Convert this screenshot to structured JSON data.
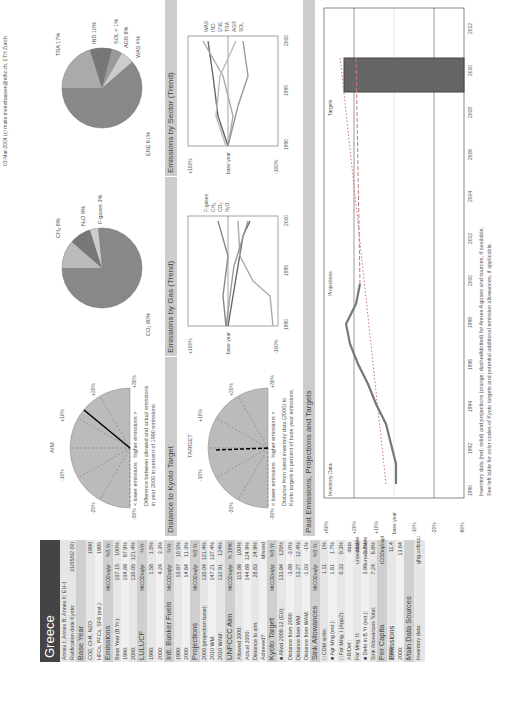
{
  "country": "Greece",
  "left": {
    "meta": [
      {
        "label": "Annex I; Annex B; Annex II; EU-15",
        "v": "",
        "p": ""
      },
      {
        "label": "Ratification date Kyoto:",
        "v": "31/05/02 (R)",
        "p": ""
      }
    ],
    "sections": [
      {
        "title": "Base Year",
        "unit": "",
        "unit2": "",
        "rows": [
          {
            "l": "CO2, CH4, N2O",
            "v": "",
            "p": "1990"
          },
          {
            "l": "HFCs, PFCs, SF6 (est.):",
            "v": "",
            "p": "1995"
          }
        ]
      },
      {
        "title": "Emissions",
        "unit": "MtCO2eq/yr",
        "unit2": "%B.Yr.",
        "rows": [
          {
            "l": "Base Year (B.Yr.):",
            "v": "107.15",
            "p": "100%"
          },
          {
            "l": "1990:",
            "v": "104.89",
            "p": "97.9%"
          },
          {
            "l": "2000:",
            "v": "130.05",
            "p": "121.4%"
          }
        ]
      },
      {
        "title": "LULUCF",
        "unit": "MtCO2eq/yr",
        "unit2": "%Yr.",
        "rows": [
          {
            "l": "1990:",
            "v": "1.58",
            "p": "1.5%"
          },
          {
            "l": "2000:",
            "v": "4.24",
            "p": "3.3%"
          }
        ]
      },
      {
        "title": "Intl. Bunker Fuels",
        "unit": "MtCO2eq/yr",
        "unit2": "%Yr.",
        "rows": [
          {
            "l": "1990:",
            "v": "10.97",
            "p": "10.5%"
          },
          {
            "l": "2000:",
            "v": "14.64",
            "p": "11.3%"
          }
        ]
      },
      {
        "title": "Projections",
        "unit": "MtCO2eq/yr",
        "unit2": "%B.Yr.",
        "rows": [
          {
            "l": "2000 (projection base):",
            "v": "130.04",
            "p": "121.4%"
          },
          {
            "l": "2010 WM:",
            "v": "147.21",
            "p": "137.4%"
          },
          {
            "l": "2010 WAM:",
            "v": "132.91",
            "p": "124%"
          }
        ]
      },
      {
        "title": "UNFCCC Aim",
        "unit": "MtCO2eq/yr",
        "unit2": "% 1990",
        "rows": [
          {
            "l": "Allowed 2000:",
            "v": "115.86",
            "p": "100%"
          },
          {
            "l": "Actual 2000:",
            "v": "144.69",
            "p": "124.9%"
          },
          {
            "l": "Distance to aim:",
            "v": "28.83",
            "p": "24.9%"
          },
          {
            "l": "Achieved?:",
            "v": "",
            "p": "Missed"
          }
        ]
      },
      {
        "title": "Kyoto Target",
        "unit": "MtCO2eq/yr",
        "unit2": "%B.Yr.",
        "rows": [
          {
            "l": "■ Allwd 2008-12 (EU):",
            "v": "133.94",
            "p": "125%"
          },
          {
            "l": "Distance from 2000:",
            "v": "-3.89",
            "p": "-3.0%"
          },
          {
            "l": "Distance from WM:",
            "v": "13.27",
            "p": "12.4%"
          },
          {
            "l": "Distance from WAM:",
            "v": "-1.03",
            "p": "-1%"
          }
        ]
      },
      {
        "title": "Sink Allowances",
        "unit": "MtCO2eq/yr",
        "unit2": "%B.Yr.",
        "rows": [
          {
            "l": "□ CDM sinks:",
            "v": "1.11",
            "p": "1%"
          },
          {
            "l": "■ Agr Mng (est.):",
            "v": "1.81",
            "p": "1.7%"
          },
          {
            "l": "□ For Mng. I (AppZ):",
            "v": "0.33",
            "p": "0.3%"
          },
          {
            "l": "AR/Def.:",
            "v": "",
            "p": "data unavailable"
          },
          {
            "l": "For Mng. II:",
            "v": "",
            "p": "data unavailable"
          },
          {
            "l": "■ Defo in B.Yr (est.):",
            "v": "3.99",
            "p": "3.7%"
          },
          {
            "l": "Sink Allowances Total:",
            "v": "7.24",
            "p": "6.8%"
          }
        ]
      },
      {
        "title": "Per Capita Emissions",
        "unit": "",
        "unit2": "tCO2eq/cap/yr",
        "rows": [
          {
            "l": "1990:",
            "v": "",
            "p": "11.4"
          },
          {
            "l": "2000:",
            "v": "",
            "p": "13.64"
          }
        ]
      },
      {
        "title": "Main Data Sources",
        "unit": "",
        "unit2": "",
        "rows": [
          {
            "l": "Inventory data:",
            "v": "",
            "p": "ghg.unfccc.int"
          }
        ]
      }
    ]
  },
  "panels": {
    "aim": {
      "title": "Distance to UNFCCC Aim",
      "gauge_label": "AIM",
      "caption1": "Difference between allowed and actual emissions",
      "caption2": "in year 2000 in percent of 1990 emissions.",
      "lower": "< lower emissions",
      "higher": "higher emissions >"
    },
    "kyoto": {
      "title": "Distance to Kyoto Target",
      "gauge_label": "TARGET",
      "caption1": "Distance from latest inventory data (2000) to",
      "caption2": "Kyoto targets in percent of base year emissions.",
      "lower": "< lower emissions",
      "higher": "higher emissions >"
    },
    "gas_title": "Emissions by Gas (Trend)",
    "sector_title": "Emissions by Sector (Trend)",
    "past_title": "Past Emissions, Projections and Targets",
    "footnote1": "Inventory data (red; solid) and projections (orange; dashed/dotted) for Annex A gases and sources, if available.",
    "footnote2": "See left table for color codes of Kyoto targets and potential additional emission allowances, if applicable.",
    "copyright": "03-Mar-2004 (c) malte.meinshausen@ethz.ch, ETH Zurich"
  },
  "chart_data": [
    {
      "type": "pie",
      "title": "Emissions by Gas",
      "labels": [
        "CO2",
        "CH4",
        "N2O",
        "F-gases"
      ],
      "values": [
        80,
        8,
        9,
        3
      ]
    },
    {
      "type": "pie",
      "title": "Emissions by Sector",
      "labels": [
        "ENE",
        "TRA",
        "IND",
        "SOL",
        "AGR",
        "WAS"
      ],
      "values": [
        61,
        17,
        10,
        1,
        8,
        4
      ]
    },
    {
      "type": "line",
      "title": "Past Emissions, Projections and Targets",
      "x": [
        1990,
        1991,
        1992,
        1993,
        1994,
        1995,
        1996,
        1997,
        1998,
        1999,
        2000
      ],
      "series": [
        {
          "name": "Inventory data",
          "values": [
            -2.1,
            -2.1,
            -1,
            0.5,
            6,
            7.5,
            11,
            14,
            17.5,
            16.5,
            21.4
          ]
        },
        {
          "name": "Projections WM (dotted)",
          "x": [
            1990,
            2010
          ],
          "values": [
            4,
            37
          ]
        },
        {
          "name": "Projections WAM (dashed)",
          "x": [
            2000,
            2010
          ],
          "values": [
            21.4,
            24
          ]
        }
      ],
      "target": {
        "x": [
          2008,
          2012
        ],
        "value": 25
      },
      "xlabel": "",
      "ylabel": "",
      "xticks": [
        1990,
        1992,
        1994,
        1996,
        1998,
        2000,
        2002,
        2004,
        2006,
        2008,
        2010,
        2012
      ],
      "yticks": [
        "-60%",
        "-50%",
        "-40%",
        "-30%",
        "-20%",
        "-10%",
        "base year",
        "+10%",
        "+20%",
        "+30%",
        "+40%",
        "+50%",
        "+60%"
      ],
      "annotations": [
        "Inventory Data",
        "Projections",
        "Targets"
      ]
    }
  ]
}
